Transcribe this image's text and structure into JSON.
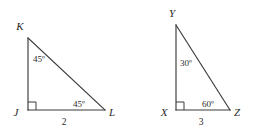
{
  "figure": {
    "background_color": "#ffffff",
    "line_color": "#3a3a3a",
    "text_color": "#2b2b2b",
    "triangles": [
      {
        "id": "triangle-jkl",
        "name": "JKL",
        "vertices": [
          {
            "label": "K",
            "x": 28,
            "y": 38,
            "label_x": 20,
            "label_y": 30
          },
          {
            "label": "J",
            "x": 28,
            "y": 110,
            "label_x": 14,
            "label_y": 115
          },
          {
            "label": "L",
            "x": 105,
            "y": 110,
            "label_x": 110,
            "label_y": 115
          }
        ],
        "angles": [
          {
            "at": "K",
            "value": "45º",
            "x": 34,
            "y": 58
          },
          {
            "at": "J",
            "value": "90º",
            "x": 0,
            "y": 0,
            "right_angle": true
          },
          {
            "at": "L",
            "value": "45º",
            "x": 74,
            "y": 104
          }
        ],
        "sides": [
          {
            "between": "JL",
            "value": "2",
            "x": 63,
            "y": 124
          }
        ]
      },
      {
        "id": "triangle-xyz",
        "name": "XYZ",
        "vertices": [
          {
            "label": "Y",
            "x": 176,
            "y": 25,
            "label_x": 170,
            "label_y": 17
          },
          {
            "label": "X",
            "x": 176,
            "y": 110,
            "label_x": 162,
            "label_y": 115
          },
          {
            "label": "Z",
            "x": 230,
            "y": 110,
            "label_x": 235,
            "label_y": 115
          }
        ],
        "angles": [
          {
            "at": "Y",
            "value": "30º",
            "x": 180,
            "y": 62
          },
          {
            "at": "X",
            "value": "90º",
            "x": 0,
            "y": 0,
            "right_angle": true
          },
          {
            "at": "Z",
            "value": "60º",
            "x": 203,
            "y": 104
          }
        ],
        "sides": [
          {
            "between": "XZ",
            "value": "3",
            "x": 200,
            "y": 124
          }
        ]
      }
    ]
  },
  "labels": {
    "left": {
      "vertex_top": "K",
      "vertex_bottom_left": "J",
      "vertex_bottom_right": "L",
      "angle_top": "45º",
      "angle_bottom_right": "45º",
      "side_bottom": "2"
    },
    "right": {
      "vertex_top": "Y",
      "vertex_bottom_left": "X",
      "vertex_bottom_right": "Z",
      "angle_top": "30º",
      "angle_bottom_right": "60º",
      "side_bottom": "3"
    }
  }
}
